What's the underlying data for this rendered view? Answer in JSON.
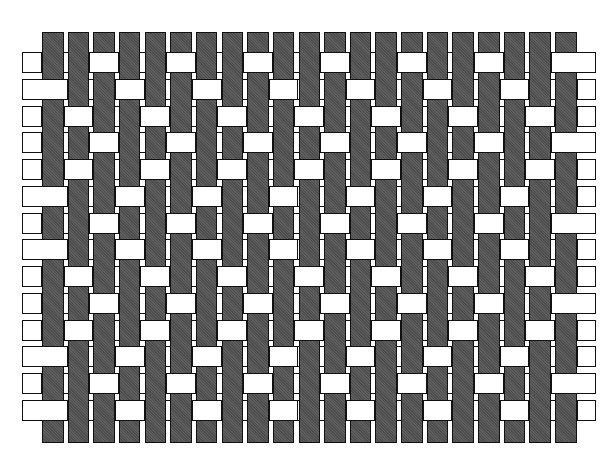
{
  "diagram": {
    "type": "weave-pattern",
    "colors": {
      "warp": "#565656",
      "weft": "#ffffff",
      "outline": "#111111",
      "background": "#ffffff"
    },
    "warps": {
      "count": 21,
      "first_left": 42,
      "pitch": 25.65,
      "width": 21.5,
      "top": 32,
      "bottom": 443
    },
    "wefts": {
      "count": 14,
      "first_top": 52,
      "pitch": 26.75,
      "height": 21,
      "left": 22,
      "right": 596
    },
    "float_period": 3,
    "row_float_offsets": [
      2,
      0,
      1,
      2,
      1,
      0,
      2,
      0,
      1,
      2,
      1,
      0,
      2,
      0
    ]
  }
}
